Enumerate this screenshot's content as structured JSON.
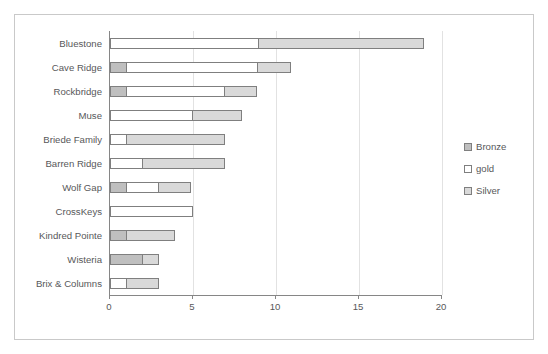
{
  "chart_data": {
    "type": "bar",
    "orientation": "horizontal",
    "stacked": true,
    "title": "",
    "xlabel": "",
    "ylabel": "",
    "xlim": [
      0,
      20
    ],
    "xticks": [
      0,
      5,
      10,
      15,
      20
    ],
    "xticklabels": [
      "0",
      "5",
      "10",
      "15",
      "20"
    ],
    "grid": true,
    "legend_position": "right",
    "categories": [
      "Bluestone",
      "Cave Ridge",
      "Rockbridge",
      "Muse",
      "Briede Family",
      "Barren Ridge",
      "Wolf Gap",
      "CrossKeys",
      "Kindred Pointe",
      "Wisteria",
      "Brix & Columns"
    ],
    "series": [
      {
        "name": "Bronze",
        "color": "#bfbfbf",
        "values": [
          0,
          1,
          1,
          0,
          0,
          0,
          1,
          0,
          1,
          2,
          0
        ]
      },
      {
        "name": "gold",
        "color": "#ffffff",
        "values": [
          9,
          8,
          6,
          5,
          1,
          2,
          2,
          5,
          0,
          0,
          1
        ]
      },
      {
        "name": "Silver",
        "color": "#d9d9d9",
        "values": [
          10,
          2,
          2,
          3,
          6,
          5,
          2,
          0,
          3,
          1,
          2
        ]
      }
    ],
    "totals": [
      19,
      11,
      9,
      8,
      7,
      7,
      5,
      5,
      4,
      3,
      3
    ]
  },
  "legend": {
    "items": [
      {
        "label": "Bronze"
      },
      {
        "label": "gold"
      },
      {
        "label": "Silver"
      }
    ]
  }
}
